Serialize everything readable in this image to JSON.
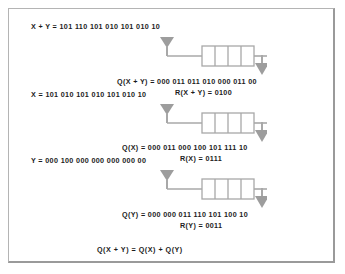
{
  "figure": {
    "background_color": "#ffffff",
    "frame_color": "#b4b4b4",
    "line_color": "#a0a0a0",
    "arrow_color": "#9d9d9d",
    "text_color": "#1c1c1c"
  },
  "sections": [
    {
      "id": "sum",
      "input_label": "X + Y = 101 110 101 010 101 010 10",
      "quotient_label": "Q(X + Y) = 000 011 011 010 000 011 00",
      "remainder_label": "R(X + Y) = 0100",
      "register_cells": 4
    },
    {
      "id": "x",
      "input_label": "X = 101 010 101 010 101 010 10",
      "quotient_label": "Q(X) = 000 011 000 100 101 111 10",
      "remainder_label": "R(X) = 0111",
      "register_cells": 4
    },
    {
      "id": "y",
      "input_label": "Y = 000 100 000 000 000 000 00",
      "quotient_label": "Q(Y) = 000 000 011 110 101 100 10",
      "remainder_label": "R(Y) = 0011",
      "register_cells": 4
    }
  ],
  "footer": {
    "equation": "Q(X + Y) = Q(X) + Q(Y)"
  },
  "icons": {
    "input_arrow": "arrow-down-icon",
    "output_arrow": "arrow-down-icon"
  }
}
